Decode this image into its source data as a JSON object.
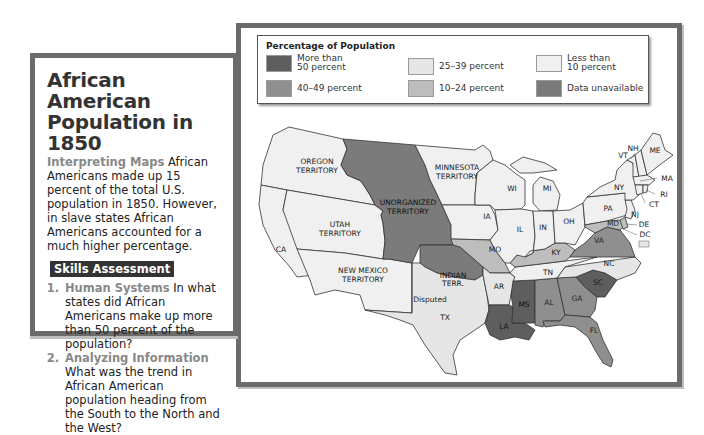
{
  "panel": {
    "title": "African American Population in 1850",
    "intro_lead": "Interpreting Maps",
    "intro_text": " African Americans made up 15 percent of the total U.S. population in 1850. However, in slave states African Americans accounted for a much higher percentage.",
    "skills_header": "Skills Assessment",
    "questions": [
      {
        "number": "1.",
        "lead": "Human Systems",
        "text": " In what states did African Americans make up more than 50 percent of the population?"
      },
      {
        "number": "2.",
        "lead": "Analyzing Information",
        "text": " What was the trend in African American population heading from the South to the North and the West?"
      }
    ]
  },
  "legend": {
    "title": "Percentage of Population",
    "items": [
      {
        "label": "More than\n50 percent",
        "color": "#5e5e5e"
      },
      {
        "label": "40–49 percent",
        "color": "#8f8f8f"
      },
      {
        "label": "25–39 percent",
        "color": "#e6e6e6"
      },
      {
        "label": "10–24 percent",
        "color": "#bdbdbd"
      },
      {
        "label": "Less than\n10 percent",
        "color": "#f0f0f0"
      },
      {
        "label": "Data unavailable",
        "color": "#7b7b7b"
      }
    ]
  },
  "map": {
    "regions": {
      "oregon": {
        "label1": "OREGON",
        "label2": "TERRITORY",
        "category": "Less than 10 percent"
      },
      "unorganized": {
        "label1": "UNORGANIZED",
        "label2": "TERRITORY",
        "category": "Data unavailable"
      },
      "minnesota": {
        "label1": "MINNESOTA",
        "label2": "TERRITORY",
        "category": "Less than 10 percent"
      },
      "utah": {
        "label1": "UTAH",
        "label2": "TERRITORY",
        "category": "Less than 10 percent"
      },
      "ca": {
        "label": "CA",
        "category": "Less than 10 percent"
      },
      "newmexico": {
        "label1": "NEW MEXICO",
        "label2": "TERRITORY",
        "category": "Less than 10 percent"
      },
      "indian": {
        "label1": "INDIAN",
        "label2": "TERR.",
        "category": "Data unavailable"
      },
      "disputed": {
        "label": "Disputed"
      },
      "tx": {
        "label": "TX",
        "category": "25–39 percent"
      },
      "ia": {
        "label": "IA",
        "category": "Less than 10 percent"
      },
      "mo": {
        "label": "MO",
        "category": "10–24 percent"
      },
      "ar": {
        "label": "AR",
        "category": "25–39 percent"
      },
      "la": {
        "label": "LA",
        "category": "More than 50 percent"
      },
      "ms": {
        "label": "MS",
        "category": "More than 50 percent"
      },
      "al": {
        "label": "AL",
        "category": "40–49 percent"
      },
      "ga": {
        "label": "GA",
        "category": "40–49 percent"
      },
      "fl": {
        "label": "FL",
        "category": "40–49 percent"
      },
      "sc": {
        "label": "SC",
        "category": "More than 50 percent"
      },
      "nc": {
        "label": "NC",
        "category": "25–39 percent"
      },
      "tn": {
        "label": "TN",
        "category": "25–39 percent"
      },
      "ky": {
        "label": "KY",
        "category": "10–24 percent"
      },
      "va": {
        "label": "VA",
        "category": "40–49 percent"
      },
      "wi": {
        "label": "WI",
        "category": "Less than 10 percent"
      },
      "mi": {
        "label": "MI",
        "category": "Less than 10 percent"
      },
      "il": {
        "label": "IL",
        "category": "Less than 10 percent"
      },
      "in": {
        "label": "IN",
        "category": "Less than 10 percent"
      },
      "oh": {
        "label": "OH",
        "category": "Less than 10 percent"
      },
      "pa": {
        "label": "PA",
        "category": "Less than 10 percent"
      },
      "ny": {
        "label": "NY",
        "category": "Less than 10 percent"
      },
      "nj": {
        "label": "NJ",
        "category": "Less than 10 percent"
      },
      "md": {
        "label": "MD",
        "category": "10–24 percent"
      },
      "de": {
        "label": "DE",
        "category": "10–24 percent"
      },
      "dc": {
        "label": "DC",
        "category": "25–39 percent"
      },
      "ct": {
        "label": "CT",
        "category": "Less than 10 percent"
      },
      "ri": {
        "label": "RI",
        "category": "Less than 10 percent"
      },
      "ma": {
        "label": "MA",
        "category": "Less than 10 percent"
      },
      "vt": {
        "label": "VT",
        "category": "Less than 10 percent"
      },
      "nh": {
        "label": "NH",
        "category": "Less than 10 percent"
      },
      "me": {
        "label": "ME",
        "category": "Less than 10 percent"
      }
    }
  }
}
